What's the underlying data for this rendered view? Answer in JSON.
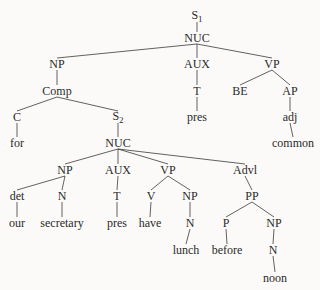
{
  "tree": {
    "nodes": [
      {
        "id": "S1",
        "label": "S",
        "sub": "1",
        "x": 197,
        "y": 16
      },
      {
        "id": "NUC1",
        "label": "NUC",
        "x": 197,
        "y": 38
      },
      {
        "id": "NP1",
        "label": "NP",
        "x": 57,
        "y": 64
      },
      {
        "id": "AUX1",
        "label": "AUX",
        "x": 197,
        "y": 64
      },
      {
        "id": "VP1",
        "label": "VP",
        "x": 272,
        "y": 64
      },
      {
        "id": "Comp",
        "label": "Comp",
        "x": 57,
        "y": 91
      },
      {
        "id": "T1",
        "label": "T",
        "x": 197,
        "y": 91
      },
      {
        "id": "BE",
        "label": "BE",
        "x": 240,
        "y": 91
      },
      {
        "id": "AP",
        "label": "AP",
        "x": 290,
        "y": 91
      },
      {
        "id": "C",
        "label": "C",
        "x": 17,
        "y": 117
      },
      {
        "id": "S2",
        "label": "S",
        "sub": "2",
        "x": 118,
        "y": 117
      },
      {
        "id": "pres1",
        "label": "pres",
        "x": 197,
        "y": 117
      },
      {
        "id": "adj",
        "label": "adj",
        "x": 290,
        "y": 117
      },
      {
        "id": "for",
        "label": "for",
        "x": 17,
        "y": 143
      },
      {
        "id": "NUC2",
        "label": "NUC",
        "x": 118,
        "y": 143
      },
      {
        "id": "common",
        "label": "common",
        "x": 293,
        "y": 143
      },
      {
        "id": "NP2",
        "label": "NP",
        "x": 65,
        "y": 170
      },
      {
        "id": "AUX2",
        "label": "AUX",
        "x": 118,
        "y": 170
      },
      {
        "id": "VP2",
        "label": "VP",
        "x": 168,
        "y": 170
      },
      {
        "id": "Advl",
        "label": "Advl",
        "x": 245,
        "y": 170
      },
      {
        "id": "det",
        "label": "det",
        "x": 17,
        "y": 196
      },
      {
        "id": "N1",
        "label": "N",
        "x": 62,
        "y": 196
      },
      {
        "id": "T2",
        "label": "T",
        "x": 117,
        "y": 196
      },
      {
        "id": "V",
        "label": "V",
        "x": 151,
        "y": 196
      },
      {
        "id": "NP3",
        "label": "NP",
        "x": 190,
        "y": 196
      },
      {
        "id": "PP",
        "label": "PP",
        "x": 252,
        "y": 196
      },
      {
        "id": "our",
        "label": "our",
        "x": 17,
        "y": 223
      },
      {
        "id": "secretary",
        "label": "secretary",
        "x": 62,
        "y": 223
      },
      {
        "id": "pres2",
        "label": "pres",
        "x": 117,
        "y": 223
      },
      {
        "id": "have",
        "label": "have",
        "x": 150,
        "y": 223
      },
      {
        "id": "N2",
        "label": "N",
        "x": 190,
        "y": 223
      },
      {
        "id": "P",
        "label": "P",
        "x": 226,
        "y": 223
      },
      {
        "id": "NP4",
        "label": "NP",
        "x": 274,
        "y": 223
      },
      {
        "id": "lunch",
        "label": "lunch",
        "x": 186,
        "y": 250
      },
      {
        "id": "before",
        "label": "before",
        "x": 227,
        "y": 250
      },
      {
        "id": "N3",
        "label": "N",
        "x": 273,
        "y": 250
      },
      {
        "id": "noon",
        "label": "noon",
        "x": 275,
        "y": 278
      }
    ],
    "edges": [
      [
        "S1",
        "NUC1"
      ],
      [
        "NUC1",
        "NP1"
      ],
      [
        "NUC1",
        "AUX1"
      ],
      [
        "NUC1",
        "VP1"
      ],
      [
        "NP1",
        "Comp"
      ],
      [
        "AUX1",
        "T1"
      ],
      [
        "VP1",
        "BE"
      ],
      [
        "VP1",
        "AP"
      ],
      [
        "Comp",
        "C"
      ],
      [
        "Comp",
        "S2"
      ],
      [
        "T1",
        "pres1"
      ],
      [
        "AP",
        "adj"
      ],
      [
        "C",
        "for"
      ],
      [
        "S2",
        "NUC2"
      ],
      [
        "adj",
        "common"
      ],
      [
        "NUC2",
        "NP2"
      ],
      [
        "NUC2",
        "AUX2"
      ],
      [
        "NUC2",
        "VP2"
      ],
      [
        "NUC2",
        "Advl"
      ],
      [
        "NP2",
        "det"
      ],
      [
        "NP2",
        "N1"
      ],
      [
        "AUX2",
        "T2"
      ],
      [
        "VP2",
        "V"
      ],
      [
        "VP2",
        "NP3"
      ],
      [
        "Advl",
        "PP"
      ],
      [
        "det",
        "our"
      ],
      [
        "N1",
        "secretary"
      ],
      [
        "T2",
        "pres2"
      ],
      [
        "V",
        "have"
      ],
      [
        "NP3",
        "N2"
      ],
      [
        "PP",
        "P"
      ],
      [
        "PP",
        "NP4"
      ],
      [
        "N2",
        "lunch"
      ],
      [
        "P",
        "before"
      ],
      [
        "NP4",
        "N3"
      ],
      [
        "N3",
        "noon"
      ]
    ]
  },
  "colors": {
    "line": "#3a3a3a",
    "text": "#2a2a2a",
    "background": "#fbfaf8"
  }
}
